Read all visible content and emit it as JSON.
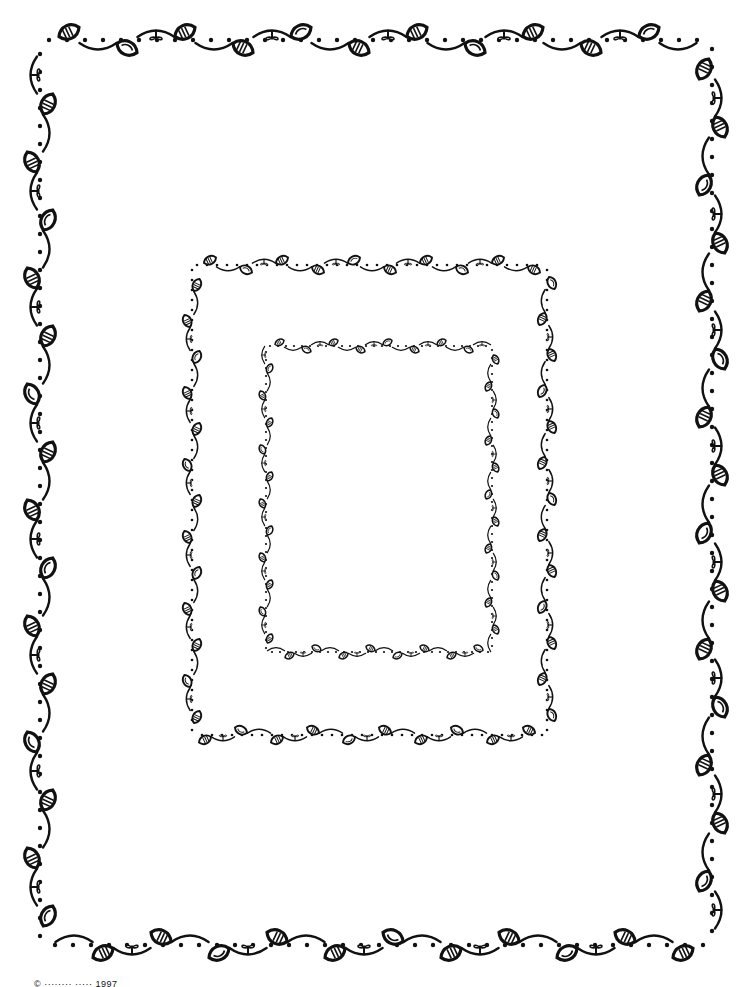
{
  "page": {
    "width": 740,
    "height": 987,
    "background": "#ffffff",
    "ink": "#111111",
    "caption": "© ········ ····· 1997"
  },
  "frames": [
    {
      "name": "outer-frame",
      "x": 40,
      "y": 40,
      "w": 672,
      "h": 905,
      "scale": 1.0,
      "leafSpacing": 58,
      "dotSpacing": 18
    },
    {
      "name": "middle-frame",
      "x": 192,
      "y": 265,
      "w": 355,
      "h": 470,
      "scale": 0.6,
      "leafSpacing": 36,
      "dotSpacing": 10
    },
    {
      "name": "inner-frame",
      "x": 266,
      "y": 346,
      "w": 226,
      "h": 306,
      "scale": 0.45,
      "leafSpacing": 27,
      "dotSpacing": 8
    }
  ]
}
